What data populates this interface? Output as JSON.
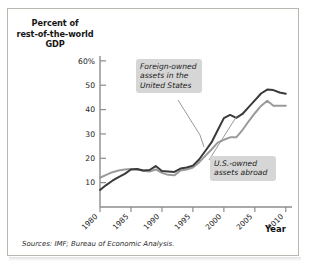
{
  "figure": {
    "ytitle": "Percent of rest-of-the-world GDP",
    "ytitle_lines": [
      "Percent of",
      "rest-of-the-world",
      "GDP"
    ],
    "xaxis_label": "Year",
    "sources": "Sources: IMF; Bureau of Economic Analysis.",
    "callouts": [
      {
        "id": "foreign",
        "text": "Foreign-owned assets in the United States"
      },
      {
        "id": "usowned",
        "text": "U.S.-owned assets abroad"
      }
    ]
  },
  "colors": {
    "series_foreign": "#3a3a3a",
    "series_usowned": "#9a9a9a",
    "axis": "#8d8d8d",
    "frame": "#b9b6b0",
    "callout_bg": "#d6d6d6",
    "text": "#161616"
  },
  "chart_data": {
    "type": "line",
    "title": "",
    "subtitle": "",
    "xlabel": "Year",
    "ylabel": "Percent of rest-of-the-world GDP",
    "xlim": [
      1980,
      2011
    ],
    "ylim": [
      0,
      62
    ],
    "grid": false,
    "legend": "annotations",
    "ytick_labels": [
      "60%",
      "50",
      "40",
      "30",
      "20",
      "10"
    ],
    "ytick_values": [
      60,
      50,
      40,
      30,
      20,
      10
    ],
    "xtick_labels": [
      "1980",
      "1985",
      "1990",
      "1995",
      "2000",
      "2005",
      "2010"
    ],
    "xtick_values": [
      1980,
      1985,
      1990,
      1995,
      2000,
      2005,
      2010
    ],
    "x": [
      1980,
      1981,
      1982,
      1983,
      1984,
      1985,
      1986,
      1987,
      1988,
      1989,
      1990,
      1991,
      1992,
      1993,
      1994,
      1995,
      1996,
      1997,
      1998,
      1999,
      2000,
      2001,
      2002,
      2003,
      2004,
      2005,
      2006,
      2007,
      2008,
      2009,
      2010
    ],
    "series": [
      {
        "name": "Foreign-owned assets in the United States",
        "color": "#3a3a3a",
        "values": [
          7.0,
          9.0,
          10.8,
          12.3,
          13.6,
          15.4,
          15.6,
          15.0,
          15.2,
          16.8,
          14.8,
          14.6,
          14.4,
          15.8,
          16.2,
          17.0,
          19.5,
          23.0,
          26.5,
          31.5,
          36.5,
          37.8,
          36.6,
          38.2,
          41.0,
          43.8,
          46.6,
          48.2,
          48.0,
          47.0,
          46.5
        ]
      },
      {
        "name": "U.S.-owned assets abroad",
        "color": "#9a9a9a",
        "values": [
          12.0,
          13.2,
          14.3,
          15.0,
          15.4,
          15.6,
          15.4,
          14.9,
          14.6,
          15.4,
          14.0,
          13.2,
          13.0,
          15.0,
          15.4,
          16.2,
          18.3,
          21.0,
          23.6,
          26.4,
          27.6,
          28.6,
          28.6,
          31.6,
          35.2,
          38.5,
          41.5,
          43.6,
          41.6,
          41.6,
          41.6
        ]
      }
    ],
    "annotations": [
      {
        "text": "Foreign-owned assets in the United States",
        "target_x": 1998,
        "target_y": 27
      },
      {
        "text": "U.S.-owned assets abroad",
        "target_x": 2001,
        "target_y": 37
      }
    ]
  }
}
